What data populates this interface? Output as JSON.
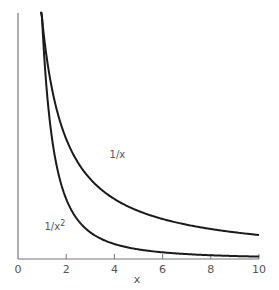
{
  "chart_data": {
    "type": "line",
    "title": "",
    "xlabel": "x",
    "ylabel": "",
    "xlim": [
      0,
      10
    ],
    "ylim": [
      0,
      1.03
    ],
    "grid": false,
    "legend": "none (inline curve labels)",
    "x_ticks": [
      0,
      2,
      4,
      6,
      8,
      10
    ],
    "x_tick_labels": [
      "0",
      "2",
      "4",
      "6",
      "8",
      "10"
    ],
    "y_ticks": [],
    "series": [
      {
        "name": "1/x",
        "label": "1/x",
        "label_position": [
          3.8,
          0.42
        ],
        "function": "1/x",
        "x": [
          0.93,
          1,
          1.5,
          2,
          3,
          4,
          5,
          6,
          7,
          8,
          9,
          10
        ],
        "values": [
          1.075,
          1.0,
          0.667,
          0.5,
          0.333,
          0.25,
          0.2,
          0.167,
          0.143,
          0.125,
          0.111,
          0.1
        ]
      },
      {
        "name": "1/x^2",
        "label": "1/x",
        "label_superscript": "2",
        "label_position": [
          1.1,
          0.12
        ],
        "function": "1/x^2",
        "x": [
          0.95,
          1,
          1.5,
          2,
          3,
          4,
          5,
          6,
          7,
          8,
          9,
          10
        ],
        "values": [
          1.108,
          1.0,
          0.444,
          0.25,
          0.111,
          0.0625,
          0.04,
          0.028,
          0.02,
          0.016,
          0.012,
          0.01
        ]
      }
    ],
    "colors": {
      "curves": "#1a1a1a",
      "axes": "#777777",
      "text": "#555555",
      "background": "#ffffff"
    }
  },
  "plot_area": {
    "x0_px": 18,
    "x10_px": 259,
    "axis_y_px": 259,
    "y_px_per_unit": 240,
    "top_px": 12
  }
}
